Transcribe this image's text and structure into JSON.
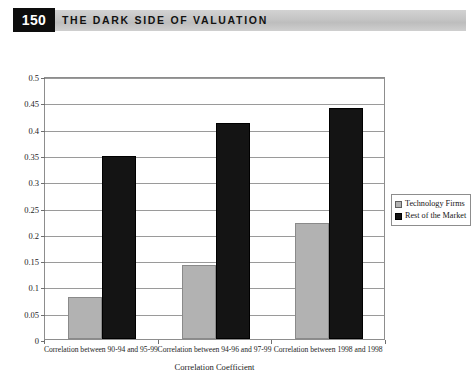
{
  "header": {
    "page_number": "150",
    "running_head": "The Dark Side of Valuation"
  },
  "legend": {
    "position": "right",
    "items": [
      {
        "label": "Technology Firms",
        "color": "#b2b2b2"
      },
      {
        "label": "Rest of the Market",
        "color": "#141414"
      }
    ]
  },
  "chart_data": {
    "type": "bar",
    "title": "",
    "xlabel": "Correlation Coefficient",
    "ylabel": "",
    "ylim": [
      0,
      0.5
    ],
    "ytick_labels": [
      "0",
      "0.05",
      "0.1",
      "0.15",
      "0.2",
      "0.25",
      "0.3",
      "0.35",
      "0.4",
      "0.45",
      "0.5"
    ],
    "ytick_values": [
      0,
      0.05,
      0.1,
      0.15,
      0.2,
      0.25,
      0.3,
      0.35,
      0.4,
      0.45,
      0.5
    ],
    "grid": true,
    "categories": [
      "Correlation between 90-94 and 95-99",
      "Correlation between 94-96 and 97-99",
      "Correlation between 1998 and 1998"
    ],
    "series": [
      {
        "name": "Technology Firms",
        "color": "#b2b2b2",
        "values": [
          0.08,
          0.14,
          0.22
        ]
      },
      {
        "name": "Rest of the Market",
        "color": "#141414",
        "values": [
          0.348,
          0.41,
          0.44
        ]
      }
    ]
  }
}
